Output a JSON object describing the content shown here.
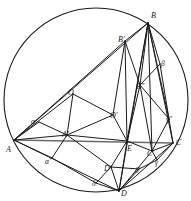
{
  "figure": {
    "width": 191,
    "height": 201,
    "background_color": "#ffffff",
    "stroke_color": "#1a1a1a",
    "axis_line_color": "#6b6b6b",
    "circle": {
      "name": "circumscribing-circle",
      "cx": 96,
      "cy": 100,
      "r": 92,
      "stroke": "#1a1a1a",
      "stroke_width": 1.1
    },
    "points": [
      {
        "id": "A",
        "label": "A",
        "x": 14,
        "y": 140,
        "label_x": 6,
        "label_y": 146,
        "kind": "vertex"
      },
      {
        "id": "B",
        "label": "B",
        "x": 148,
        "y": 23,
        "label_x": 151,
        "label_y": 12,
        "kind": "vertex"
      },
      {
        "id": "C",
        "label": "C",
        "x": 173,
        "y": 143,
        "label_x": 176,
        "label_y": 139,
        "kind": "vertex"
      },
      {
        "id": "D",
        "label": "D",
        "x": 119,
        "y": 191,
        "label_x": 121,
        "label_y": 190,
        "kind": "vertex"
      },
      {
        "id": "E",
        "label": "E",
        "x": 127,
        "y": 141,
        "label_x": 127,
        "label_y": 145,
        "kind": "intersection"
      },
      {
        "id": "O",
        "label": "O",
        "x": 73,
        "y": 94,
        "label_x": 68,
        "label_y": 89,
        "kind": "center"
      },
      {
        "id": "Oprime",
        "label": "O'",
        "x": 113,
        "y": 115,
        "label_x": 110,
        "label_y": 112,
        "kind": "center"
      },
      {
        "id": "Aprime",
        "label": "A'",
        "x": 67,
        "y": 135,
        "label_x": 62,
        "label_y": 131,
        "kind": "derived"
      },
      {
        "id": "Bprime",
        "label": "B'",
        "x": 125,
        "y": 41,
        "label_x": 118,
        "label_y": 36,
        "kind": "derived"
      },
      {
        "id": "Cprime",
        "label": "C'",
        "x": 152,
        "y": 151,
        "label_x": 147,
        "label_y": 150,
        "kind": "derived"
      },
      {
        "id": "Dprime",
        "label": "D'",
        "x": 111,
        "y": 167,
        "label_x": 104,
        "label_y": 165,
        "kind": "derived"
      },
      {
        "id": "Bdprime",
        "label": "B''",
        "x": 140,
        "y": 85,
        "label_x": 136,
        "label_y": 83,
        "kind": "derived"
      },
      {
        "id": "alpha",
        "label": "α",
        "x": 39,
        "y": 122,
        "label_x": 31,
        "label_y": 118,
        "kind": "greek"
      },
      {
        "id": "alphapr",
        "label": "α'",
        "x": 52,
        "y": 158,
        "label_x": 45,
        "label_y": 158,
        "kind": "greek"
      },
      {
        "id": "beta",
        "label": "β",
        "x": 160,
        "y": 64,
        "label_x": 161,
        "label_y": 60,
        "kind": "greek"
      },
      {
        "id": "gamma",
        "label": "γ",
        "x": 157,
        "y": 160,
        "label_x": 155,
        "label_y": 159,
        "kind": "greek"
      },
      {
        "id": "gammadpr",
        "label": "γ''",
        "x": 169,
        "y": 119,
        "label_x": 166,
        "label_y": 116,
        "kind": "greek"
      },
      {
        "id": "delta",
        "label": "δ",
        "x": 96,
        "y": 183,
        "label_x": 92,
        "label_y": 180,
        "kind": "greek"
      },
      {
        "id": "deltapr",
        "label": "δ'",
        "x": 139,
        "y": 169,
        "label_x": 135,
        "label_y": 167,
        "kind": "greek"
      }
    ],
    "segments": [
      {
        "name": "seg-A-C-baseline",
        "from": "A",
        "to": "C",
        "color": "#6b6b6b",
        "width": 1.6
      },
      {
        "name": "seg-A-B",
        "from": "A",
        "to": "B",
        "color": "#1a1a1a",
        "width": 1.0
      },
      {
        "name": "seg-A-D",
        "from": "A",
        "to": "D",
        "color": "#1a1a1a",
        "width": 1.0
      },
      {
        "name": "seg-B-D",
        "from": "B",
        "to": "D",
        "color": "#1a1a1a",
        "width": 1.0
      },
      {
        "name": "seg-B-C",
        "from": "B",
        "to": "C",
        "color": "#1a1a1a",
        "width": 1.0
      },
      {
        "name": "seg-C-D",
        "from": "C",
        "to": "D",
        "color": "#1a1a1a",
        "width": 1.0
      },
      {
        "name": "seg-A-alpha",
        "from": "A",
        "to": "alpha",
        "color": "#1a1a1a",
        "width": 1.0
      },
      {
        "name": "seg-A-alphapr",
        "from": "A",
        "to": "alphapr",
        "color": "#1a1a1a",
        "width": 1.0
      },
      {
        "name": "seg-alpha-Aprime",
        "from": "alpha",
        "to": "Aprime",
        "color": "#1a1a1a",
        "width": 1.0
      },
      {
        "name": "seg-alphapr-Aprime",
        "from": "alphapr",
        "to": "Aprime",
        "color": "#1a1a1a",
        "width": 1.0
      },
      {
        "name": "seg-A-Aprime",
        "from": "A",
        "to": "Aprime",
        "color": "#1a1a1a",
        "width": 1.0
      },
      {
        "name": "seg-A-O",
        "from": "A",
        "to": "O",
        "color": "#1a1a1a",
        "width": 1.0
      },
      {
        "name": "seg-O-Oprime",
        "from": "O",
        "to": "Oprime",
        "color": "#1a1a1a",
        "width": 1.0
      },
      {
        "name": "seg-Aprime-Oprime",
        "from": "Aprime",
        "to": "Oprime",
        "color": "#1a1a1a",
        "width": 1.0
      },
      {
        "name": "seg-Aprime-O",
        "from": "Aprime",
        "to": "O",
        "color": "#1a1a1a",
        "width": 1.0
      },
      {
        "name": "seg-Oprime-Bprime",
        "from": "Oprime",
        "to": "Bprime",
        "color": "#1a1a1a",
        "width": 1.0
      },
      {
        "name": "seg-A-Bprime",
        "from": "A",
        "to": "Bprime",
        "color": "#1a1a1a",
        "width": 1.0
      },
      {
        "name": "seg-Bprime-B",
        "from": "Bprime",
        "to": "B",
        "color": "#1a1a1a",
        "width": 1.0
      },
      {
        "name": "seg-Bprime-Bdprime",
        "from": "Bprime",
        "to": "Bdprime",
        "color": "#1a1a1a",
        "width": 1.0
      },
      {
        "name": "seg-Bprime-E",
        "from": "Bprime",
        "to": "E",
        "color": "#1a1a1a",
        "width": 1.0
      },
      {
        "name": "seg-B-Bdprime",
        "from": "B",
        "to": "Bdprime",
        "color": "#1a1a1a",
        "width": 1.0
      },
      {
        "name": "seg-B-beta",
        "from": "B",
        "to": "beta",
        "color": "#1a1a1a",
        "width": 1.0
      },
      {
        "name": "seg-beta-Bdprime",
        "from": "beta",
        "to": "Bdprime",
        "color": "#1a1a1a",
        "width": 1.0
      },
      {
        "name": "seg-beta-gammadpr",
        "from": "beta",
        "to": "gammadpr",
        "color": "#1a1a1a",
        "width": 1.0
      },
      {
        "name": "seg-B-gammadpr",
        "from": "B",
        "to": "gammadpr",
        "color": "#1a1a1a",
        "width": 1.0
      },
      {
        "name": "seg-Bdprime-Cprime",
        "from": "Bdprime",
        "to": "Cprime",
        "color": "#1a1a1a",
        "width": 1.0
      },
      {
        "name": "seg-Bdprime-E",
        "from": "Bdprime",
        "to": "E",
        "color": "#1a1a1a",
        "width": 1.0
      },
      {
        "name": "seg-E-D",
        "from": "E",
        "to": "D",
        "color": "#1a1a1a",
        "width": 1.0
      },
      {
        "name": "seg-E-Dprime",
        "from": "E",
        "to": "Dprime",
        "color": "#1a1a1a",
        "width": 1.0
      },
      {
        "name": "seg-Oprime-E",
        "from": "Oprime",
        "to": "E",
        "color": "#1a1a1a",
        "width": 1.0
      },
      {
        "name": "seg-Aprime-Dprime",
        "from": "Aprime",
        "to": "Dprime",
        "color": "#1a1a1a",
        "width": 1.0
      },
      {
        "name": "seg-Dprime-D",
        "from": "Dprime",
        "to": "D",
        "color": "#1a1a1a",
        "width": 1.0
      },
      {
        "name": "seg-Dprime-deltapr",
        "from": "Dprime",
        "to": "deltapr",
        "color": "#1a1a1a",
        "width": 1.0
      },
      {
        "name": "seg-delta-D",
        "from": "delta",
        "to": "D",
        "color": "#1a1a1a",
        "width": 1.0
      },
      {
        "name": "seg-delta-Dprime",
        "from": "delta",
        "to": "Dprime",
        "color": "#1a1a1a",
        "width": 1.0
      },
      {
        "name": "seg-D-deltapr",
        "from": "D",
        "to": "deltapr",
        "color": "#1a1a1a",
        "width": 1.0
      },
      {
        "name": "seg-deltapr-gamma",
        "from": "deltapr",
        "to": "gamma",
        "color": "#1a1a1a",
        "width": 1.0
      },
      {
        "name": "seg-gamma-Cprime",
        "from": "gamma",
        "to": "Cprime",
        "color": "#1a1a1a",
        "width": 1.0
      },
      {
        "name": "seg-gamma-C",
        "from": "gamma",
        "to": "C",
        "color": "#1a1a1a",
        "width": 1.0
      },
      {
        "name": "seg-Cprime-C",
        "from": "Cprime",
        "to": "C",
        "color": "#1a1a1a",
        "width": 1.0
      },
      {
        "name": "seg-Cprime-gammadpr",
        "from": "Cprime",
        "to": "gammadpr",
        "color": "#1a1a1a",
        "width": 1.0
      },
      {
        "name": "seg-gammadpr-C",
        "from": "gammadpr",
        "to": "C",
        "color": "#1a1a1a",
        "width": 1.0
      },
      {
        "name": "seg-D-C",
        "from": "D",
        "to": "Cprime",
        "color": "#1a1a1a",
        "width": 1.0
      },
      {
        "name": "seg-E-Cprime",
        "from": "E",
        "to": "Cprime",
        "color": "#1a1a1a",
        "width": 1.0
      },
      {
        "name": "seg-Aprime-E",
        "from": "Aprime",
        "to": "E",
        "color": "#1a1a1a",
        "width": 1.0
      },
      {
        "name": "seg-alphapr-D",
        "from": "alphapr",
        "to": "delta",
        "color": "#1a1a1a",
        "width": 1.0
      },
      {
        "name": "seg-B-E",
        "from": "B",
        "to": "E",
        "color": "#1a1a1a",
        "width": 1.0
      },
      {
        "name": "seg-B-Cprime",
        "from": "B",
        "to": "Cprime",
        "color": "#1a1a1a",
        "width": 1.0
      },
      {
        "name": "seg-Bdprime-gammadpr",
        "from": "Bdprime",
        "to": "gammadpr",
        "color": "#1a1a1a",
        "width": 1.0
      }
    ]
  }
}
